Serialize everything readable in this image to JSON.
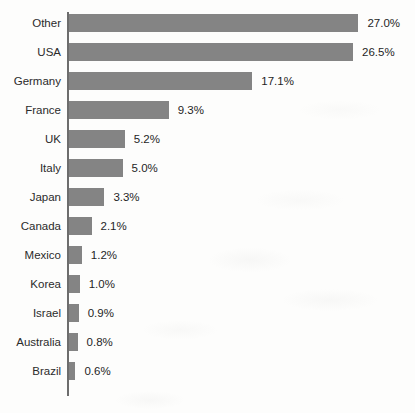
{
  "chart_data": {
    "type": "bar",
    "orientation": "horizontal",
    "title": "",
    "subtitle": "",
    "xlabel": "",
    "ylabel": "",
    "grid": false,
    "legend": null,
    "value_suffix": "%",
    "xlim": [
      0,
      27.0
    ],
    "categories": [
      "Other",
      "USA",
      "Germany",
      "France",
      "UK",
      "Italy",
      "Japan",
      "Canada",
      "Mexico",
      "Korea",
      "Israel",
      "Australia",
      "Brazil"
    ],
    "values": [
      27.0,
      26.5,
      17.1,
      9.3,
      5.2,
      5.0,
      3.3,
      2.1,
      1.2,
      1.0,
      0.9,
      0.8,
      0.6
    ],
    "value_labels": [
      "27.0%",
      "26.5%",
      "17.1%",
      "9.3%",
      "5.2%",
      "5.0%",
      "3.3%",
      "2.1%",
      "1.2%",
      "1.0%",
      "0.9%",
      "0.8%",
      "0.6%"
    ],
    "series": [
      {
        "name": "Share",
        "color": "#848484",
        "values": [
          27.0,
          26.5,
          17.1,
          9.3,
          5.2,
          5.0,
          3.3,
          2.1,
          1.2,
          1.0,
          0.9,
          0.8,
          0.6
        ]
      }
    ]
  },
  "style": {
    "bar_color": "#848484",
    "axis_color": "#6d6d6d",
    "label_color": "#2b2b2b",
    "value_color": "#1f1f1f",
    "background": "#fdfdfc"
  },
  "geometry": {
    "axis_x": 67,
    "bar_start_x": 69,
    "first_row_top": 14,
    "row_pitch": 29,
    "bar_height": 18,
    "px_per_unit": 10.72,
    "value_gap": 9
  }
}
